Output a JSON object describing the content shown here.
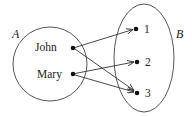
{
  "diagram": {
    "type": "mapping",
    "sets": [
      {
        "id": "A",
        "label": "A",
        "elements": [
          "John",
          "Mary"
        ]
      },
      {
        "id": "B",
        "label": "B",
        "elements": [
          "1",
          "2",
          "3"
        ]
      }
    ],
    "labels": {
      "set_a": "A",
      "set_b": "B",
      "john": "John",
      "mary": "Mary",
      "one": "1",
      "two": "2",
      "three": "3"
    },
    "mappings": [
      {
        "from": "John",
        "to": "1"
      },
      {
        "from": "John",
        "to": "3"
      },
      {
        "from": "Mary",
        "to": "2"
      },
      {
        "from": "Mary",
        "to": "3"
      }
    ],
    "colors": {
      "stroke": "#444444",
      "dot": "#111111",
      "text": "#222222",
      "background": "#ffffff"
    }
  }
}
